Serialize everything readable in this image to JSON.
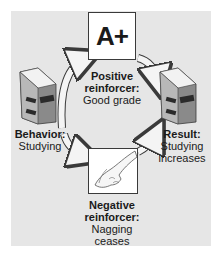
{
  "diagram": {
    "type": "reinforcement-cycle",
    "colors": {
      "panel": "#e6e6e6",
      "arrow_fill": "#f4f4f4",
      "arrow_stroke": "#3a3a3a",
      "book_cover": "#8a8a8a",
      "book_band": "#2b2b2b",
      "card": "#ffffff"
    },
    "nodes": {
      "positive": {
        "card_text": "A+",
        "title": "Positive reinforcer:",
        "title_line1": "Positive",
        "title_line2": "reinforcer:",
        "detail": "Good grade"
      },
      "behavior": {
        "title": "Behavior:",
        "detail": "Studying"
      },
      "result": {
        "title": "Result:",
        "detail_line1": "Studying",
        "detail_line2": "increases"
      },
      "negative": {
        "title_line1": "Negative",
        "title_line2": "reinforcer:",
        "detail_line1": "Nagging",
        "detail_line2": "ceases"
      }
    },
    "edges": [
      {
        "from": "behavior",
        "to": "positive"
      },
      {
        "from": "positive",
        "to": "result"
      },
      {
        "from": "behavior",
        "to": "negative"
      },
      {
        "from": "negative",
        "to": "result"
      }
    ]
  }
}
